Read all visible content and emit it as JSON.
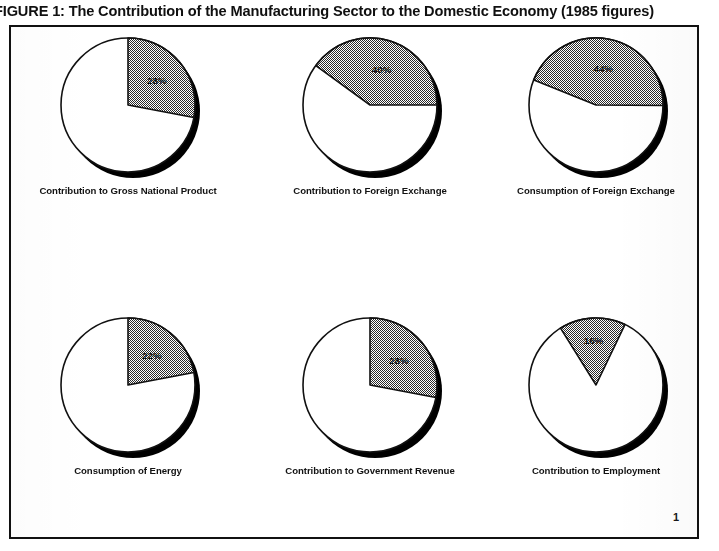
{
  "figure": {
    "title": "FIGURE 1: The Contribution of the Manufacturing Sector to the Domestic Economy (1985 figures)",
    "page_number": "1"
  },
  "chart_data": [
    {
      "type": "pie",
      "title": "Contribution to Gross National Product",
      "categories": [
        "Manufacturing sector",
        "Rest of economy"
      ],
      "values": [
        28,
        72
      ],
      "labels": [
        "28%",
        ""
      ],
      "value_label": "28%",
      "start_angle_deg": 0,
      "sweep_deg": 100.8,
      "colors": [
        "#b9b9b9",
        "#ffffff"
      ]
    },
    {
      "type": "pie",
      "title": "Contribution to Foreign Exchange",
      "categories": [
        "Manufacturing sector",
        "Rest of economy"
      ],
      "values": [
        40,
        60
      ],
      "labels": [
        "40%",
        ""
      ],
      "value_label": "40%",
      "start_angle_deg": -54,
      "sweep_deg": 144,
      "colors": [
        "#b9b9b9",
        "#ffffff"
      ]
    },
    {
      "type": "pie",
      "title": "Consumption of Foreign Exchange",
      "categories": [
        "Manufacturing sector",
        "Rest of economy"
      ],
      "values": [
        44,
        56
      ],
      "labels": [
        "44%",
        ""
      ],
      "value_label": "44%",
      "start_angle_deg": -68,
      "sweep_deg": 158.4,
      "colors": [
        "#b9b9b9",
        "#ffffff"
      ]
    },
    {
      "type": "pie",
      "title": "Consumption of Energy",
      "categories": [
        "Manufacturing sector",
        "Rest of economy"
      ],
      "values": [
        22,
        78
      ],
      "labels": [
        "22%",
        ""
      ],
      "value_label": "22%",
      "start_angle_deg": 0,
      "sweep_deg": 79.2,
      "colors": [
        "#b9b9b9",
        "#ffffff"
      ]
    },
    {
      "type": "pie",
      "title": "Contribution to Government Revenue",
      "categories": [
        "Manufacturing sector",
        "Rest of economy"
      ],
      "values": [
        28,
        72
      ],
      "labels": [
        "28%",
        ""
      ],
      "value_label": "28%",
      "start_angle_deg": 0,
      "sweep_deg": 100.8,
      "colors": [
        "#b9b9b9",
        "#ffffff"
      ]
    },
    {
      "type": "pie",
      "title": "Contribution to Employment",
      "categories": [
        "Manufacturing sector",
        "Rest of economy"
      ],
      "values": [
        16,
        84
      ],
      "labels": [
        "16%",
        ""
      ],
      "value_label": "16%",
      "start_angle_deg": -32,
      "sweep_deg": 57.6,
      "colors": [
        "#b9b9b9",
        "#ffffff"
      ]
    }
  ]
}
